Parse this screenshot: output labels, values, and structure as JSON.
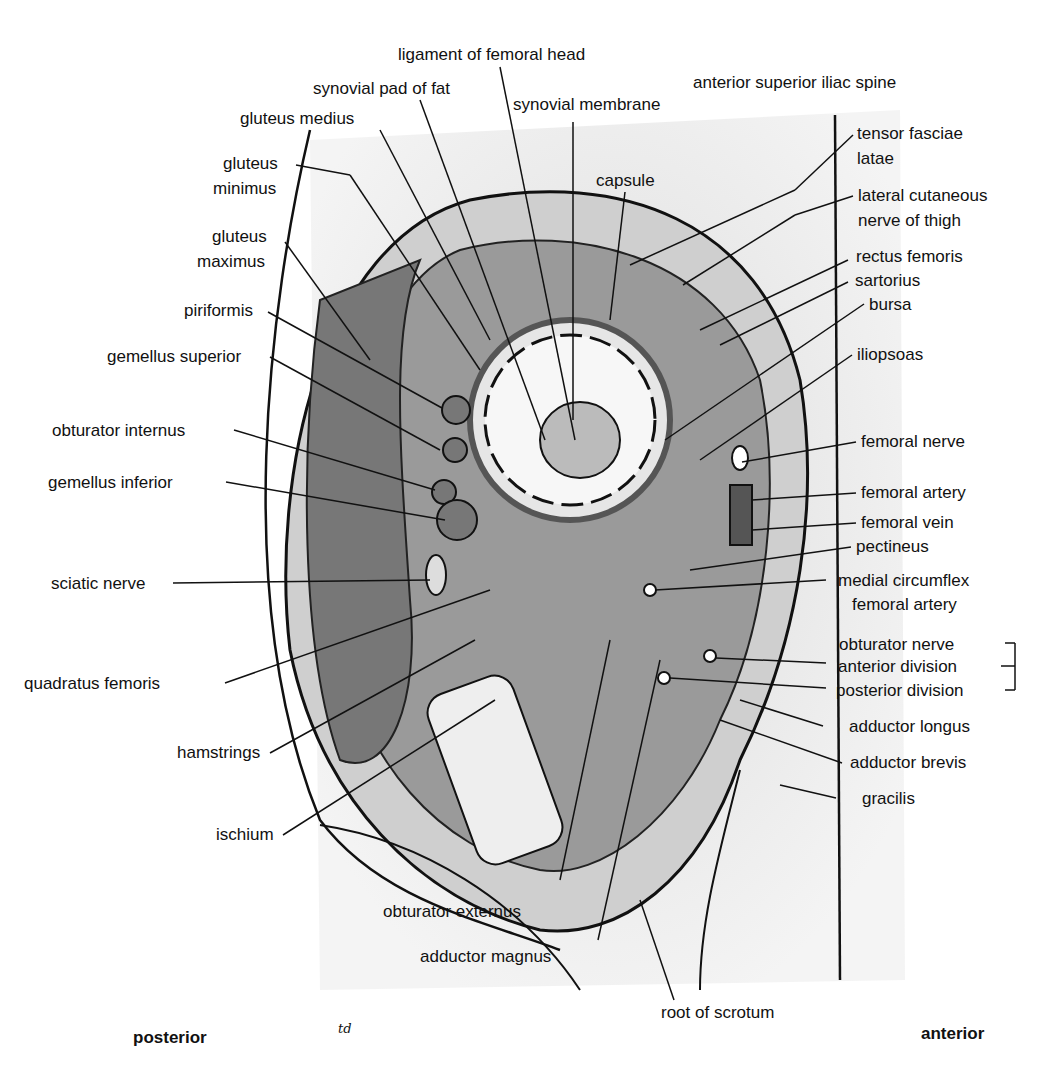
{
  "figure": {
    "orientation": {
      "left": "posterior",
      "right": "anterior"
    },
    "signature": "td",
    "labels": {
      "ligament_femoral_head": "ligament of femoral head",
      "synovial_pad": "synovial pad of fat",
      "synovial_membrane": "synovial membrane",
      "gluteus_medius": "gluteus medius",
      "gluteus_minimus_1": "gluteus",
      "gluteus_minimus_2": "minimus",
      "gluteus_maximus_1": "gluteus",
      "gluteus_maximus_2": "maximus",
      "capsule": "capsule",
      "asis": "anterior superior iliac spine",
      "tfl_1": "tensor fasciae",
      "tfl_2": "latae",
      "lcn_1": "lateral cutaneous",
      "lcn_2": "nerve of thigh",
      "rectus_femoris": "rectus femoris",
      "sartorius": "sartorius",
      "bursa": "bursa",
      "piriformis": "piriformis",
      "gemellus_superior": "gemellus superior",
      "iliopsoas": "iliopsoas",
      "obturator_internus": "obturator internus",
      "femoral_nerve": "femoral nerve",
      "gemellus_inferior": "gemellus inferior",
      "femoral_artery": "femoral artery",
      "femoral_vein": "femoral vein",
      "pectineus": "pectineus",
      "sciatic_nerve": "sciatic nerve",
      "mcfa_1": "medial circumflex",
      "mcfa_2": "femoral artery",
      "obturator_nerve": "obturator nerve",
      "anterior_division": "anterior division",
      "posterior_division": "posterior division",
      "quadratus_femoris": "quadratus femoris",
      "adductor_longus": "adductor longus",
      "adductor_brevis": "adductor brevis",
      "hamstrings": "hamstrings",
      "gracilis": "gracilis",
      "ischium": "ischium",
      "obturator_externus": "obturator externus",
      "adductor_magnus": "adductor magnus",
      "root_of_scrotum": "root of scrotum"
    }
  }
}
